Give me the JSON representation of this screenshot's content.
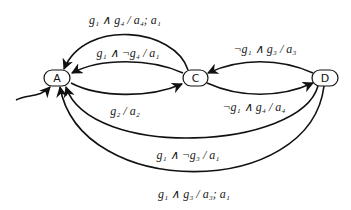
{
  "diagram": {
    "type": "state-machine",
    "nodes": [
      {
        "id": "A",
        "label": "A",
        "initial": true
      },
      {
        "id": "C",
        "label": "C"
      },
      {
        "id": "D",
        "label": "D"
      }
    ],
    "edges": [
      {
        "from": "C",
        "to": "A",
        "label": "g₁ ∧ g₄ / a₄; a₁"
      },
      {
        "from": "C",
        "to": "A",
        "label": "g₁ ∧ ¬g₄ / a₁"
      },
      {
        "from": "A",
        "to": "C",
        "label": "g₂ / a₂"
      },
      {
        "from": "D",
        "to": "C",
        "label": "¬g₁ ∧ g₃ / a₃"
      },
      {
        "from": "C",
        "to": "D",
        "label": "¬g₁ ∧ g₄ / a₄"
      },
      {
        "from": "D",
        "to": "A",
        "label": "g₁ ∧ ¬g₃ / a₁"
      },
      {
        "from": "D",
        "to": "A",
        "label": "g₁ ∧ g₃ / a₃; a₁"
      }
    ]
  }
}
